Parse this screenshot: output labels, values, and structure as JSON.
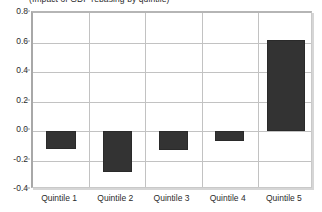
{
  "chart_data": {
    "type": "bar",
    "title": "(Impact of GDP rebasing by quintile)",
    "xlabel": "",
    "ylabel": "",
    "categories": [
      "Quintile 1",
      "Quintile 2",
      "Quintile 3",
      "Quintile 4",
      "Quintile 5"
    ],
    "values": [
      -0.12,
      -0.28,
      -0.13,
      -0.07,
      0.62
    ],
    "ylim": [
      -0.4,
      0.8
    ],
    "ytick_labels": [
      "0.8",
      "0.6",
      "0.4",
      "0.2",
      "0.0",
      "-0.2",
      "-0.4"
    ],
    "ytick_values": [
      0.8,
      0.6,
      0.4,
      0.2,
      0.0,
      -0.2,
      -0.4
    ],
    "grid": true,
    "legend": false,
    "series": [
      {
        "name": "Impact of GDP rebasing",
        "values": [
          -0.12,
          -0.28,
          -0.13,
          -0.07,
          0.62
        ]
      }
    ],
    "colors": {
      "bar_fill": "#333333",
      "bar_border": "#2a2a2a",
      "gridline": "#c2c2c2",
      "frame": "#a8a8a8",
      "text": "#2b2b2b",
      "plot_background": "#ffffff"
    }
  }
}
